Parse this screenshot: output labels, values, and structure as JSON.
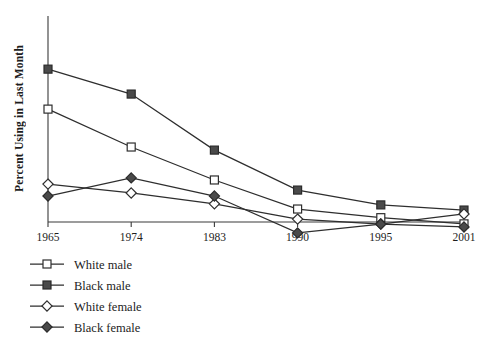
{
  "chart_data": {
    "type": "line",
    "title": "",
    "xlabel": "",
    "ylabel": "Percent Using in Last Month",
    "categories": [
      "1965",
      "1974",
      "1983",
      "1990",
      "1995",
      "2001"
    ],
    "x": [
      1965,
      1974,
      1983,
      1990,
      1995,
      2001
    ],
    "xlim": [
      1963,
      2003
    ],
    "ylim": [
      0,
      100
    ],
    "y_tick_labels": [],
    "grid": false,
    "legend_position": "below-left",
    "series": [
      {
        "name": "White male",
        "marker": "open-square",
        "values": [
          54.8,
          36.4,
          20.4,
          6.3,
          2.1,
          -0.9
        ]
      },
      {
        "name": "Black male",
        "marker": "filled-square",
        "values": [
          74.2,
          62.1,
          34.9,
          15.5,
          8.3,
          5.8
        ]
      },
      {
        "name": "White female",
        "marker": "open-diamond",
        "values": [
          18.4,
          14.1,
          8.8,
          1.4,
          -1.0,
          3.9
        ]
      },
      {
        "name": "Black female",
        "marker": "filled-diamond",
        "values": [
          12.6,
          21.4,
          12.6,
          -5.3,
          -1.0,
          -2.4
        ]
      }
    ]
  },
  "axes": {
    "y_axis_label": "Percent Using in Last Month",
    "x_tick_labels": [
      "1965",
      "1974",
      "1983",
      "1990",
      "1995",
      "2001"
    ]
  },
  "legend": {
    "items": [
      {
        "label": "White male",
        "marker": "open-square"
      },
      {
        "label": "Black male",
        "marker": "filled-square"
      },
      {
        "label": "White female",
        "marker": "open-diamond"
      },
      {
        "label": "Black female",
        "marker": "filled-diamond"
      }
    ]
  },
  "colors": {
    "line": "#2e2e2e",
    "marker_fill": "#4a4a4a",
    "marker_open": "#ffffff",
    "axis": "#3a3a3a",
    "text": "#1d1d1d",
    "background": "#ffffff"
  }
}
